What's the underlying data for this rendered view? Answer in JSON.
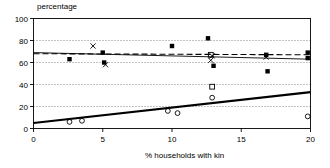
{
  "chart_data": {
    "type": "scatter",
    "title": "",
    "ylabel": "percentage",
    "xlabel": "% households with kin",
    "xlim": [
      0,
      20
    ],
    "ylim": [
      0,
      100
    ],
    "xticks": [
      0,
      5,
      10,
      15,
      20
    ],
    "yticks": [
      0,
      20,
      40,
      60,
      80,
      100
    ],
    "xtick_labels": [
      "0",
      "5",
      "10",
      "15",
      "20"
    ],
    "ytick_labels": [
      "0",
      "20",
      "40",
      "60",
      "80",
      "100"
    ],
    "grid": "horizontal dotted gridlines at each y tick",
    "legend": "none",
    "series": [
      {
        "name": "filled-square-series",
        "marker": "filled-square",
        "line": "solid-thin",
        "color": "#000000",
        "fit_endpoints": [
          [
            0,
            69
          ],
          [
            20,
            63
          ]
        ],
        "points": [
          [
            2.6,
            63
          ],
          [
            5.0,
            69
          ],
          [
            5.1,
            60
          ],
          [
            10.0,
            75
          ],
          [
            12.6,
            82
          ],
          [
            13.0,
            57
          ],
          [
            16.8,
            67
          ],
          [
            16.9,
            52
          ],
          [
            19.8,
            69
          ],
          [
            19.8,
            64
          ]
        ]
      },
      {
        "name": "cross-series",
        "marker": "x-cross",
        "line": "dashed",
        "color": "#000000",
        "fit_endpoints": [
          [
            0,
            68
          ],
          [
            20,
            67
          ]
        ],
        "points": [
          [
            4.3,
            75
          ],
          [
            5.2,
            58
          ],
          [
            12.8,
            62
          ],
          [
            12.9,
            66
          ],
          [
            16.8,
            65
          ]
        ]
      },
      {
        "name": "open-circle-series",
        "marker": "open-circle",
        "line": "solid-thick",
        "color": "#000000",
        "fit_endpoints": [
          [
            0,
            5
          ],
          [
            20,
            33
          ]
        ],
        "points": [
          [
            2.6,
            6
          ],
          [
            3.5,
            7
          ],
          [
            9.7,
            16
          ],
          [
            10.4,
            14
          ],
          [
            12.9,
            28
          ],
          [
            19.8,
            11
          ]
        ]
      },
      {
        "name": "open-square-series",
        "marker": "open-square",
        "line": "none",
        "color": "#000000",
        "points": [
          [
            12.9,
            38
          ],
          [
            12.8,
            67
          ]
        ]
      }
    ]
  },
  "axes": {
    "frame_color": "#000000"
  }
}
